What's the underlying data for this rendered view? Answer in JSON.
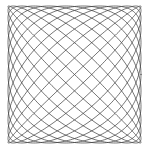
{
  "figure": {
    "title": "Lissajous curve",
    "kind": "parametric-line-plot",
    "background_color": "#ffffff",
    "stroke_color": "#3a3a3a",
    "stroke_width": 0.7,
    "canvas": {
      "width": 149,
      "height": 154
    },
    "plot_box": {
      "x": 8,
      "y": 6,
      "width": 133,
      "height": 137
    }
  },
  "chart_data": {
    "type": "line",
    "title": "Lissajous curve",
    "xlabel": "",
    "ylabel": "",
    "grid": false,
    "legend": null,
    "axes_visible": false,
    "tick_labels_x": [],
    "tick_labels_y": [],
    "xlim": [
      -1,
      1
    ],
    "ylim": [
      -1,
      1
    ],
    "parametric": {
      "x_expression": "A * sin(a * t + delta)",
      "y_expression": "B * sin(b * t)",
      "A": 1,
      "B": 1,
      "a": 13,
      "b": 12,
      "delta": 1.5707963,
      "t_start": 0,
      "t_end": 6.2831853,
      "samples": 2600,
      "lobes_horizontal": 13,
      "lobes_vertical": 12
    },
    "series": [
      {
        "name": "lissajous-13-12",
        "color": "#3a3a3a",
        "line_width": 0.7,
        "closed": true
      }
    ]
  }
}
